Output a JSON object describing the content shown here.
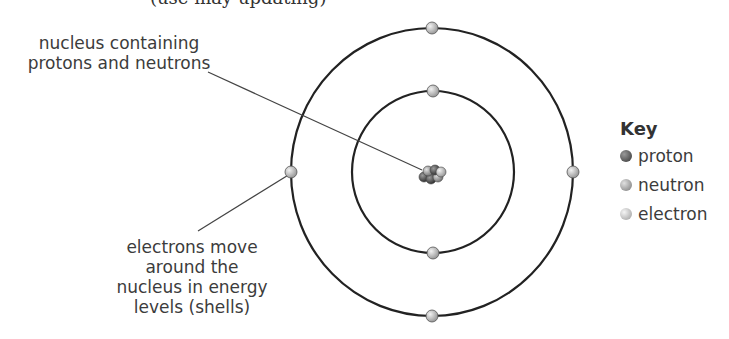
{
  "header": {
    "partial_text": "(use may updating)"
  },
  "labels": {
    "nucleus_line1": "nucleus containing",
    "nucleus_line2": "protons and neutrons",
    "electrons_line1": "electrons move",
    "electrons_line2": "around the",
    "electrons_line3": "nucleus in energy",
    "electrons_line4": "levels (shells)"
  },
  "key": {
    "title": "Key",
    "items": [
      {
        "label": "proton",
        "color": "#555555"
      },
      {
        "label": "neutron",
        "color": "#9a9a9a"
      },
      {
        "label": "electron",
        "color": "#c8c8c8"
      }
    ]
  },
  "diagram": {
    "center": [
      433,
      174
    ],
    "shells": [
      {
        "rx": 81,
        "ry": 81,
        "electrons": 2
      },
      {
        "rx": 141,
        "ry": 144,
        "electrons": 4
      }
    ]
  }
}
